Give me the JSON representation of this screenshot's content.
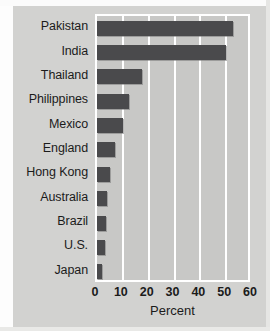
{
  "chart_data": {
    "type": "bar",
    "orientation": "horizontal",
    "title": "",
    "xlabel": "Percent",
    "ylabel": "",
    "xlim": [
      0,
      60
    ],
    "xticks": [
      "0",
      "10",
      "20",
      "30",
      "40",
      "50",
      "60"
    ],
    "xtick_values": [
      0,
      10,
      20,
      30,
      40,
      50,
      60
    ],
    "grid": true,
    "legend": false,
    "categories": [
      "Pakistan",
      "India",
      "Thailand",
      "Philippines",
      "Mexico",
      "England",
      "Hong Kong",
      "Australia",
      "Brazil",
      "U.S.",
      "Japan"
    ],
    "values": [
      52.5,
      50,
      17.5,
      12.5,
      10,
      7,
      5,
      4,
      3.5,
      3,
      2
    ],
    "bar_color": "#4a4a4c",
    "plot_background": "#c8c8c6",
    "gridline_color": "#ffffff",
    "page_background": "#d2d2d0"
  }
}
